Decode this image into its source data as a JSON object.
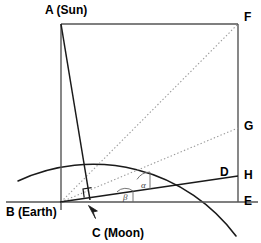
{
  "figure": {
    "type": "geometry-diagram",
    "width": 261,
    "height": 243,
    "background": "#ffffff"
  },
  "points": {
    "A": {
      "label": "A (Sun)",
      "short": "A",
      "x": 61,
      "y": 24,
      "label_x": 45,
      "label_y": 4
    },
    "B": {
      "label": "B (Earth)",
      "short": "B",
      "x": 61,
      "y": 202,
      "label_x": 6,
      "label_y": 207
    },
    "C": {
      "label": "C (Moon)",
      "short": "C",
      "x": 89,
      "y": 198,
      "label_x": 93,
      "label_y": 228
    },
    "D": {
      "label": "D",
      "short": "D",
      "x": 229,
      "y": 175,
      "label_x": 221,
      "label_y": 167
    },
    "E": {
      "label": "E",
      "short": "E",
      "x": 238,
      "y": 202,
      "label_x": 244,
      "label_y": 196
    },
    "F": {
      "label": "F",
      "short": "F",
      "x": 238,
      "y": 24,
      "label_x": 244,
      "label_y": 12
    },
    "G": {
      "label": "G",
      "short": "G",
      "x": 238,
      "y": 128,
      "label_x": 244,
      "label_y": 121
    },
    "H": {
      "label": "H",
      "short": "H",
      "x": 238,
      "y": 177,
      "label_x": 244,
      "label_y": 170
    }
  },
  "angles": {
    "alpha": {
      "label": "α",
      "label_x": 141,
      "label_y": 182
    },
    "beta": {
      "label": "β",
      "label_x": 123,
      "label_y": 194
    }
  },
  "markers": {
    "right_angle_at_c": {
      "name": "right-angle-marker",
      "x": 84,
      "y": 189,
      "size": 9
    },
    "moon_arrow": {
      "name": "moon-pointer-arrow",
      "from_x": 96,
      "from_y": 219,
      "to_x": 88,
      "to_y": 206
    }
  },
  "geometry": {
    "arc": {
      "center_x": 61,
      "center_y": 202,
      "radius": 178,
      "note": "circle centred on B through A"
    },
    "frame_rect": {
      "left": 61,
      "top": 24,
      "right": 238,
      "bottom": 202
    },
    "solid_lines": [
      {
        "name": "line-A-C",
        "x1": 61,
        "y1": 24,
        "x2": 90,
        "y2": 199
      },
      {
        "name": "line-B-D",
        "x1": 61,
        "y1": 202,
        "x2": 238,
        "y2": 176
      }
    ],
    "dotted_lines": [
      {
        "name": "line-B-F",
        "x1": 61,
        "y1": 202,
        "x2": 238,
        "y2": 24
      },
      {
        "name": "line-B-G",
        "x1": 61,
        "y1": 202,
        "x2": 238,
        "y2": 128
      }
    ],
    "baseline": {
      "name": "line-B-E-extended",
      "x1": 6,
      "y1": 202,
      "x2": 258,
      "y2": 202
    },
    "top_extension": {
      "name": "line-A-F-top",
      "x1": 61,
      "y1": 24,
      "x2": 238,
      "y2": 24
    }
  },
  "colors": {
    "stroke_solid": "#1a1a1a",
    "stroke_frame": "#555555",
    "stroke_dotted": "#9a9a9a",
    "text": "#000000",
    "angle_text": "#444444",
    "background": "#ffffff"
  }
}
